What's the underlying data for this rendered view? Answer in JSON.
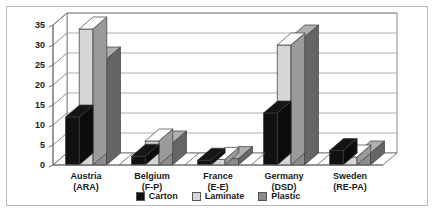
{
  "chart_data": {
    "type": "bar",
    "title": "",
    "subtitle": "",
    "xlabel": "",
    "ylabel": "",
    "ylim": [
      0,
      35
    ],
    "yticks": [
      0,
      5,
      10,
      15,
      20,
      25,
      30,
      35
    ],
    "grid": true,
    "three_d": true,
    "legend_position": "bottom",
    "categories": [
      "Austria\n(ARA)",
      "Belgium\n(F-P)",
      "France\n(E-E)",
      "Germany\n(DSD)",
      "Sweden\n(RE-PA)"
    ],
    "category_lines": [
      [
        "Austria",
        "(ARA)"
      ],
      [
        "Belgium",
        "(F-P)"
      ],
      [
        "France",
        "(E-E)"
      ],
      [
        "Germany",
        "(DSD)"
      ],
      [
        "Sweden",
        "(RE-PA)"
      ]
    ],
    "series": [
      {
        "name": "Carton",
        "color": "#111111",
        "values": [
          12,
          2.2,
          1.2,
          13,
          3.6
        ]
      },
      {
        "name": "Laminate",
        "color": "#d6d6d6",
        "values": [
          34,
          6.0,
          1.4,
          30,
          2.0
        ]
      },
      {
        "name": "Plastic",
        "color": "#8c8c8c",
        "values": [
          26.5,
          5.5,
          1.6,
          32,
          3.0
        ]
      }
    ]
  },
  "legend": {
    "items": [
      {
        "label": "Carton",
        "color": "#111111"
      },
      {
        "label": "Laminate",
        "color": "#d6d6d6"
      },
      {
        "label": "Plastic",
        "color": "#8c8c8c"
      }
    ]
  },
  "axis": {
    "y_tick_labels": [
      "0",
      "5",
      "10",
      "15",
      "20",
      "25",
      "30",
      "35"
    ]
  },
  "colors": {
    "frame_border": "#b9b9b9",
    "axis_line": "#6d6d6d",
    "gridline": "#9a9a9a",
    "floor": "#ffffff",
    "background": "#ffffff"
  }
}
